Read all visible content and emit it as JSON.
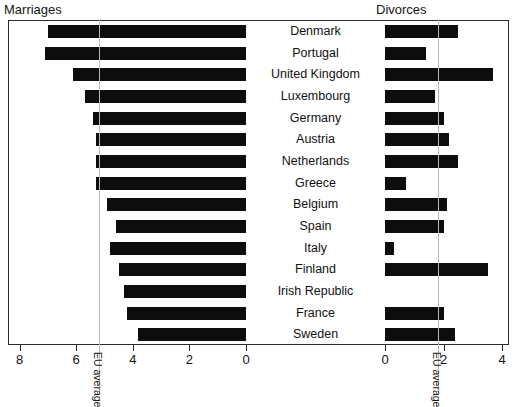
{
  "panels": {
    "left_title": "Marriages",
    "right_title": "Divorces"
  },
  "eu_average": {
    "label_left": "EU average",
    "label_right": "EU average",
    "marriages_value": 5.2,
    "divorces_value": 1.8,
    "line_color": "#b9b9b9"
  },
  "axes": {
    "left_ticks": [
      "8",
      "6",
      "4",
      "2",
      "0"
    ],
    "left_tick_values": [
      8,
      6,
      4,
      2,
      0
    ],
    "right_ticks": [
      "0",
      "2",
      "4"
    ],
    "right_tick_values": [
      0,
      2,
      4
    ]
  },
  "chart_data": {
    "type": "bar",
    "title": "",
    "subtitle": "",
    "xlabel": "",
    "ylabel": "",
    "orientation": "horizontal",
    "layout": "bidirectional-pyramid",
    "grid": false,
    "legend_position": "none",
    "bar_color": "#0d0d0d",
    "categories": [
      "Denmark",
      "Portugal",
      "United Kingdom",
      "Luxembourg",
      "Germany",
      "Austria",
      "Netherlands",
      "Greece",
      "Belgium",
      "Spain",
      "Italy",
      "Finland",
      "Irish Republic",
      "France",
      "Sweden"
    ],
    "series": [
      {
        "name": "Marriages",
        "side": "left",
        "axis_range": [
          0,
          8.6
        ],
        "axis_ticks": [
          8,
          6,
          4,
          2,
          0
        ],
        "values": [
          7.0,
          7.1,
          6.1,
          5.7,
          5.4,
          5.3,
          5.3,
          5.3,
          4.9,
          4.6,
          4.8,
          4.5,
          4.3,
          4.2,
          3.8
        ]
      },
      {
        "name": "Divorces",
        "side": "right",
        "axis_range": [
          0,
          4.4
        ],
        "axis_ticks": [
          0,
          2,
          4
        ],
        "values": [
          2.5,
          1.4,
          3.7,
          1.7,
          2.0,
          2.2,
          2.5,
          0.7,
          2.1,
          2.0,
          0.3,
          3.5,
          0.0,
          2.0,
          2.4
        ]
      }
    ]
  }
}
